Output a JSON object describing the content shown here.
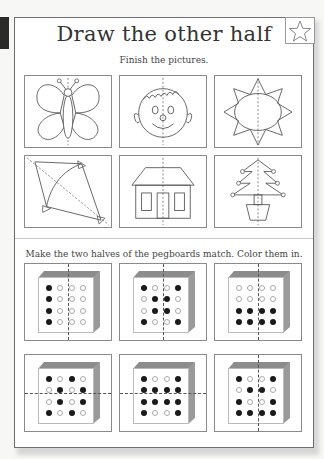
{
  "worksheet": {
    "title": "Draw the other half",
    "badge_icon": "star-icon",
    "section1": {
      "instruction": "Finish the pictures.",
      "pictures": [
        {
          "name": "butterfly",
          "icon": "butterfly-icon",
          "symmetry": "vertical"
        },
        {
          "name": "face",
          "icon": "face-icon",
          "symmetry": "vertical"
        },
        {
          "name": "sun",
          "icon": "sun-icon",
          "symmetry": "vertical"
        },
        {
          "name": "kite",
          "icon": "kite-icon",
          "symmetry": "diagonal"
        },
        {
          "name": "house",
          "icon": "house-icon",
          "symmetry": "vertical"
        },
        {
          "name": "tree",
          "icon": "christmas-tree-icon",
          "symmetry": "vertical"
        }
      ]
    },
    "section2": {
      "instruction": "Make the two halves of the pegboards match. Color them in.",
      "pegboards": [
        {
          "axis": "vertical",
          "rows": [
            [
              1,
              0,
              0,
              0
            ],
            [
              1,
              0,
              0,
              0
            ],
            [
              1,
              0,
              0,
              0
            ],
            [
              1,
              0,
              0,
              0
            ]
          ]
        },
        {
          "axis": "vertical",
          "rows": [
            [
              1,
              0,
              0,
              1
            ],
            [
              0,
              1,
              1,
              0
            ],
            [
              0,
              1,
              1,
              0
            ],
            [
              1,
              0,
              0,
              1
            ]
          ]
        },
        {
          "axis": "vertical",
          "rows": [
            [
              0,
              0,
              0,
              0
            ],
            [
              0,
              0,
              0,
              0
            ],
            [
              1,
              1,
              1,
              1
            ],
            [
              1,
              1,
              1,
              1
            ]
          ]
        },
        {
          "axis": "horizontal",
          "rows": [
            [
              1,
              0,
              1,
              0
            ],
            [
              0,
              1,
              0,
              1
            ],
            [
              0,
              1,
              0,
              1
            ],
            [
              1,
              0,
              1,
              0
            ]
          ]
        },
        {
          "axis": "horizontal",
          "rows": [
            [
              1,
              0,
              0,
              1
            ],
            [
              1,
              1,
              1,
              1
            ],
            [
              1,
              1,
              1,
              1
            ],
            [
              1,
              0,
              0,
              1
            ]
          ]
        },
        {
          "axis": "vertical",
          "rows": [
            [
              1,
              0,
              0,
              1
            ],
            [
              0,
              1,
              1,
              0
            ],
            [
              1,
              0,
              0,
              1
            ],
            [
              1,
              1,
              1,
              1
            ]
          ]
        }
      ]
    }
  }
}
